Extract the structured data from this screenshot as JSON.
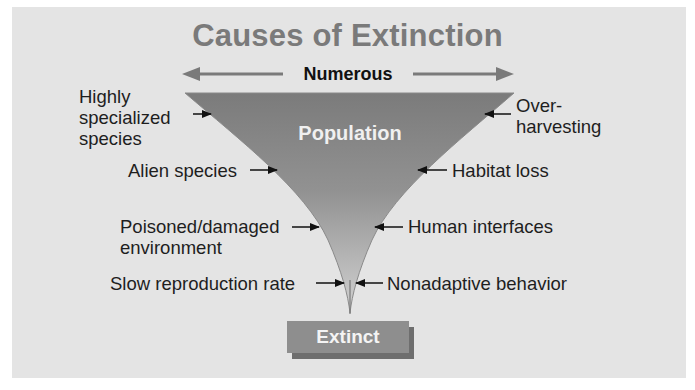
{
  "title": "Causes of Extinction",
  "top_scale": {
    "label": "Numerous",
    "direction": "bidirectional-arrow"
  },
  "funnel": {
    "label": "Population",
    "fill_top": "#7d7d7d",
    "fill_bottom": "#c9c9c9"
  },
  "left_causes": [
    {
      "lines": [
        "Highly",
        "specialized",
        "species"
      ]
    },
    {
      "lines": [
        "Alien species"
      ]
    },
    {
      "lines": [
        "Poisoned/damaged",
        "environment"
      ]
    },
    {
      "lines": [
        "Slow reproduction rate"
      ]
    }
  ],
  "right_causes": [
    {
      "lines": [
        "Over-",
        "harvesting"
      ]
    },
    {
      "lines": [
        "Habitat loss"
      ]
    },
    {
      "lines": [
        "Human interfaces"
      ]
    },
    {
      "lines": [
        "Nonadaptive behavior"
      ]
    }
  ],
  "outcome": {
    "label": "Extinct"
  },
  "colors": {
    "background": "#e4e4e4",
    "title": "#7a7a7a",
    "arrow": "#7a7a7a",
    "extinct_box": "#8e8e8e",
    "extinct_shadow": "#6e6e6e"
  }
}
